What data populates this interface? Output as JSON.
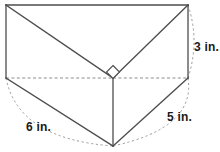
{
  "figure": {
    "kind": "triangular-prism-3d-diagram",
    "colors": {
      "solid_edge": "#4d4d4d",
      "hidden_edge": "#8c8c8c",
      "arc": "#9a9a9a",
      "label_text": "#1a1a1a",
      "background": "#ffffff"
    },
    "vertices": {
      "top_left": [
        6,
        5
      ],
      "top_right": [
        188,
        5
      ],
      "bottom_left": [
        6,
        78
      ],
      "bottom_right": [
        188,
        78
      ],
      "apex_back": [
        113,
        78
      ],
      "apex_front": [
        113,
        146
      ]
    },
    "right_angle_marker": {
      "name": "right-angle-marker",
      "center": [
        113,
        72
      ],
      "size": 7
    },
    "dimensions": [
      {
        "id": "height",
        "label": "3 in.",
        "value": 3,
        "unit": "in.",
        "edge": "right-vertical-edge",
        "arc_from": [
          188,
          5
        ],
        "arc_to": [
          188,
          78
        ]
      },
      {
        "id": "leg-right",
        "label": "5 in.",
        "value": 5,
        "unit": "in.",
        "edge": "front-right-slant-edge",
        "arc_from": [
          188,
          78
        ],
        "arc_to": [
          113,
          146
        ]
      },
      {
        "id": "leg-left",
        "label": "6 in.",
        "value": 6,
        "unit": "in.",
        "edge": "front-left-slant-edge",
        "arc_from": [
          6,
          78
        ],
        "arc_to": [
          113,
          146
        ]
      }
    ],
    "edges": {
      "solid": [
        "top-left to top-right",
        "top-left to bottom-left",
        "top-right to bottom-right",
        "top-left to apex-back",
        "top-right to apex-back",
        "bottom-left to apex-front",
        "bottom-right to apex-front",
        "apex-back to apex-front"
      ],
      "hidden_dashed": [
        "bottom-left to apex-back",
        "apex-back to bottom-right"
      ]
    }
  }
}
